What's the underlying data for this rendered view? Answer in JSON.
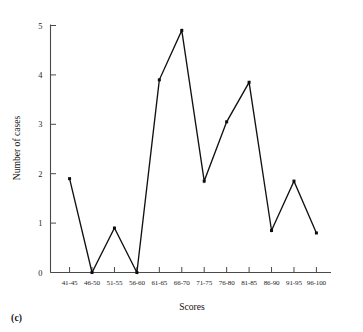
{
  "caption": "(c)",
  "chart_data": {
    "type": "line",
    "title": "",
    "subtitle": "",
    "xlabel": "Scores",
    "ylabel": "Number of cases",
    "categories": [
      "41-45",
      "46-50",
      "51-55",
      "56-60",
      "61-65",
      "66-70",
      "71-75",
      "76-80",
      "81-85",
      "86-90",
      "91-95",
      "96-100"
    ],
    "values": [
      1.9,
      0,
      0.9,
      0,
      3.9,
      4.9,
      1.85,
      3.05,
      3.85,
      0.85,
      1.85,
      0.8
    ],
    "ytick_labels": [
      "0",
      "1",
      "2",
      "3",
      "4",
      "5"
    ],
    "ytick_values": [
      0,
      1,
      2,
      3,
      4,
      5
    ],
    "ylim": [
      0,
      5
    ],
    "grid": false,
    "legend": false,
    "marker": "filled-square",
    "line_color": "#111111",
    "marker_color": "#0d0d0d",
    "axis_color": "#4a4a48",
    "background_color": "#ffffff"
  }
}
